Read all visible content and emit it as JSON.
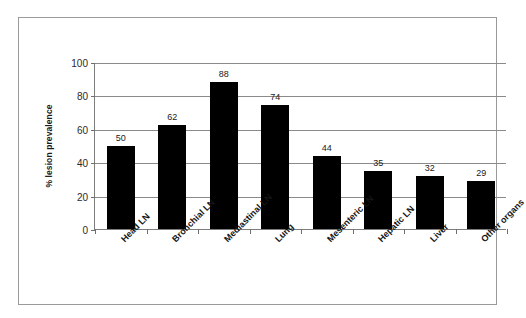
{
  "chart_data": {
    "type": "bar",
    "title": "",
    "xlabel": "",
    "ylabel": "% lesion prevalence",
    "categories": [
      "Head LN",
      "Bronchial LN",
      "Mediastinal LN",
      "Lung",
      "Mesenteric LN",
      "Hepatic LN",
      "Liver",
      "Other organs"
    ],
    "values": [
      50,
      62,
      88,
      74,
      44,
      35,
      32,
      29
    ],
    "value_labels": [
      "50",
      "62",
      "88",
      "74",
      "44",
      "35",
      "32",
      "29"
    ],
    "ylim": [
      0,
      100
    ],
    "ytick_labels": [
      "0",
      "20",
      "40",
      "60",
      "80",
      "100"
    ],
    "ytick_values": [
      0,
      20,
      40,
      60,
      80,
      100
    ],
    "grid": true,
    "legend": false,
    "bar_color": "#000000",
    "gridline_color": "#8a8a8a",
    "axis_color": "#7d7d7d",
    "frame_color": "#9a9a9a",
    "background_color": "#ffffff"
  }
}
